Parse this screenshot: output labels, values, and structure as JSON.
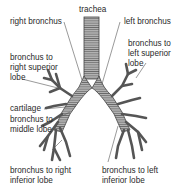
{
  "diagram": {
    "labels": {
      "trachea": "trachea",
      "right_bronchus": "right bronchus",
      "left_bronchus": "left bronchus",
      "right_superior_1": "bronchus to",
      "right_superior_2": "right superior",
      "right_superior_3": "lobe",
      "left_superior_1": "bronchus to",
      "left_superior_2": "left superior",
      "left_superior_3": "lobe",
      "cartilage": "cartilage",
      "middle_1": "bronchus to",
      "middle_2": "middle lobe",
      "right_inferior_1": "bronchus to right",
      "right_inferior_2": "inferior lobe",
      "left_inferior_1": "bronchus to left",
      "left_inferior_2": "inferior lobe"
    },
    "colors": {
      "airway_fill": "#9a9a9a",
      "airway_stroke": "#444444",
      "leader": "#555555",
      "text": "#2a2a2a"
    }
  }
}
